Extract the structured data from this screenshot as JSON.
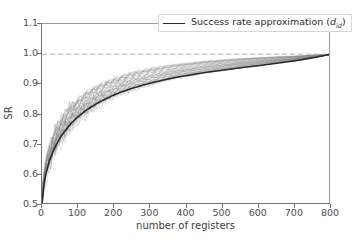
{
  "figure": {
    "background": "#ffffff",
    "axis_color": "#6f6f6f"
  },
  "legend": {
    "position": "upper center",
    "entries": [
      {
        "label_prefix": "Success rate approximation (",
        "label_var": "d",
        "label_sub": "id",
        "label_suffix": ")",
        "color": "#2b2b2b",
        "style": "solid"
      }
    ]
  },
  "axis": {
    "xlabel": "number of registers",
    "ylabel": "SR",
    "xticks": [
      "0",
      "100",
      "200",
      "300",
      "400",
      "500",
      "600",
      "700",
      "800"
    ],
    "yticks": [
      "0.5",
      "0.6",
      "0.7",
      "0.8",
      "0.9",
      "1.0",
      "1.1"
    ]
  },
  "chart_data": {
    "type": "line",
    "title": "",
    "subtitle": "",
    "xlabel": "number of registers",
    "ylabel": "SR",
    "xlim": [
      0,
      800
    ],
    "ylim": [
      0.5,
      1.1
    ],
    "xticks": [
      0,
      100,
      200,
      300,
      400,
      500,
      600,
      700,
      800
    ],
    "yticks": [
      0.5,
      0.6,
      0.7,
      0.8,
      0.9,
      1.0,
      1.1
    ],
    "grid": false,
    "legend_position": "upper center",
    "legend_entries": [
      "Success rate approximation (d_id)"
    ],
    "annotations": [
      {
        "type": "hline",
        "y": 1.0,
        "style": "dashed",
        "color": "#b0b0b0",
        "label": ""
      }
    ],
    "series": [
      {
        "name": "Success rate approximation (d_id)",
        "color": "#2b2b2b",
        "style": "solid",
        "linewidth": 1.6,
        "x": [
          0,
          5,
          10,
          20,
          30,
          40,
          50,
          60,
          80,
          100,
          120,
          140,
          160,
          180,
          200,
          225,
          250,
          275,
          300,
          325,
          350,
          375,
          400,
          450,
          500,
          550,
          600,
          650,
          700,
          750,
          800
        ],
        "values": [
          0.5,
          0.567,
          0.6,
          0.645,
          0.676,
          0.701,
          0.722,
          0.74,
          0.77,
          0.793,
          0.812,
          0.828,
          0.842,
          0.854,
          0.865,
          0.877,
          0.887,
          0.896,
          0.904,
          0.911,
          0.918,
          0.924,
          0.929,
          0.939,
          0.947,
          0.955,
          0.962,
          0.97,
          0.978,
          0.988,
          1.0
        ]
      },
      {
        "name": "empirical success rate runs (band upper envelope)",
        "color": "#a8a8a8",
        "style": "solid",
        "linewidth": 0.6,
        "x": [
          0,
          5,
          10,
          20,
          30,
          40,
          50,
          60,
          80,
          100,
          120,
          140,
          160,
          180,
          200,
          225,
          250,
          275,
          300,
          325,
          350,
          375,
          400,
          450,
          500,
          550,
          600,
          650,
          700,
          750,
          800
        ],
        "values": [
          0.52,
          0.62,
          0.655,
          0.705,
          0.742,
          0.772,
          0.796,
          0.815,
          0.846,
          0.869,
          0.888,
          0.902,
          0.915,
          0.925,
          0.934,
          0.944,
          0.952,
          0.959,
          0.965,
          0.969,
          0.974,
          0.977,
          0.98,
          0.985,
          0.989,
          0.992,
          0.994,
          0.996,
          0.997,
          0.999,
          1.0
        ]
      },
      {
        "name": "empirical success rate runs (band lower envelope)",
        "color": "#a8a8a8",
        "style": "solid",
        "linewidth": 0.6,
        "x": [
          0,
          5,
          10,
          20,
          30,
          40,
          50,
          60,
          80,
          100,
          120,
          140,
          160,
          180,
          200,
          225,
          250,
          275,
          300,
          325,
          350,
          375,
          400,
          450,
          500,
          550,
          600,
          650,
          700,
          750,
          800
        ],
        "values": [
          0.5,
          0.545,
          0.575,
          0.618,
          0.648,
          0.672,
          0.692,
          0.71,
          0.74,
          0.764,
          0.784,
          0.801,
          0.816,
          0.829,
          0.841,
          0.855,
          0.866,
          0.877,
          0.886,
          0.895,
          0.903,
          0.91,
          0.916,
          0.928,
          0.938,
          0.948,
          0.957,
          0.966,
          0.975,
          0.986,
          0.998
        ]
      },
      {
        "name": "empirical success rate runs (band median)",
        "color": "#8f8f8f",
        "style": "solid",
        "linewidth": 0.6,
        "x": [
          0,
          5,
          10,
          20,
          30,
          40,
          50,
          60,
          80,
          100,
          120,
          140,
          160,
          180,
          200,
          225,
          250,
          275,
          300,
          325,
          350,
          375,
          400,
          450,
          500,
          550,
          600,
          650,
          700,
          750,
          800
        ],
        "values": [
          0.51,
          0.585,
          0.617,
          0.663,
          0.696,
          0.723,
          0.745,
          0.764,
          0.794,
          0.818,
          0.838,
          0.854,
          0.867,
          0.878,
          0.888,
          0.9,
          0.91,
          0.919,
          0.926,
          0.933,
          0.939,
          0.945,
          0.95,
          0.958,
          0.965,
          0.971,
          0.977,
          0.982,
          0.987,
          0.993,
          1.0
        ]
      }
    ]
  }
}
